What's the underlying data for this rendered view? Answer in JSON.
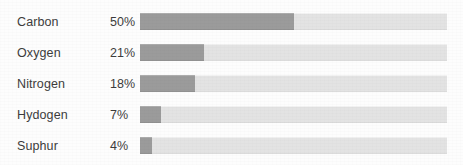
{
  "chart_data": {
    "type": "bar",
    "orientation": "horizontal",
    "title": "",
    "xlabel": "",
    "ylabel": "",
    "xlim": [
      0,
      100
    ],
    "grid": false,
    "legend": null,
    "value_suffix": "%",
    "categories": [
      "Carbon",
      "Oxygen",
      "Nitrogen",
      "Hydogen",
      "Suphur"
    ],
    "values": [
      50,
      21,
      18,
      7,
      4
    ],
    "value_labels": [
      "50%",
      "21%",
      "18%",
      "7%",
      "4%"
    ],
    "colors": {
      "fill": "#9b9b9b",
      "track": "#e3e3e3",
      "text": "#3c3c3c",
      "background": "#fdfdfd"
    },
    "rows": [
      {
        "label": "Carbon",
        "value": 50,
        "value_label": "50%"
      },
      {
        "label": "Oxygen",
        "value": 21,
        "value_label": "21%"
      },
      {
        "label": "Nitrogen",
        "value": 18,
        "value_label": "18%"
      },
      {
        "label": "Hydogen",
        "value": 7,
        "value_label": "7%"
      },
      {
        "label": "Suphur",
        "value": 4,
        "value_label": "4%"
      }
    ]
  }
}
